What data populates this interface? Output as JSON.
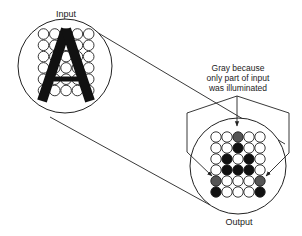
{
  "labels": {
    "input": "Input",
    "output": "Output",
    "note_line1": "Gray because",
    "note_line2": "only part of input",
    "note_line3": "was illuminated"
  },
  "input_letter": "A",
  "grid": {
    "cols": 5,
    "rows": 6
  },
  "output_grid": [
    [
      "white",
      "white",
      "gray",
      "white",
      "white"
    ],
    [
      "white",
      "white",
      "black",
      "white",
      "white"
    ],
    [
      "white",
      "black",
      "white",
      "black",
      "white"
    ],
    [
      "white",
      "black",
      "black",
      "black",
      "white"
    ],
    [
      "gray",
      "white",
      "white",
      "white",
      "gray"
    ],
    [
      "black",
      "white",
      "white",
      "white",
      "black"
    ]
  ],
  "colors": {
    "black": "#111111",
    "gray": "#555555",
    "white": "#ffffff",
    "line": "#222222"
  }
}
